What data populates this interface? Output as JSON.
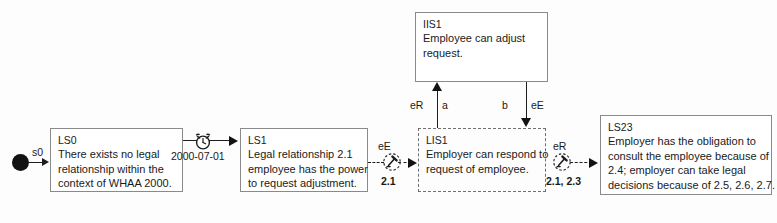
{
  "diagram": {
    "start_node": {
      "name": "start-state",
      "label": "s0"
    },
    "states": [
      {
        "id": "LS0",
        "style": "solid",
        "lines": [
          "There exists no legal",
          "relationship within the",
          "context of WHAA 2000."
        ]
      },
      {
        "id": "LS1",
        "style": "solid",
        "lines": [
          "Legal relationship 2.1",
          "employee has the power",
          "to request adjustment."
        ]
      },
      {
        "id": "LIS1",
        "style": "dashed",
        "lines": [
          "Employer can respond to",
          "request of employee."
        ]
      },
      {
        "id": "IIS1",
        "style": "solid",
        "lines": [
          "Employee can adjust",
          "request."
        ]
      },
      {
        "id": "LS23",
        "style": "solid",
        "lines": [
          "Employer has the obligation to",
          "consult the employee because of",
          "2.4; employer can take legal",
          "decisions because of 2.5, 2.6, 2.7."
        ]
      }
    ],
    "transitions": {
      "clock_date": "2000-07-01",
      "t1_top": "eE",
      "t1_bottom": "2.1",
      "t2_top": "eR",
      "t2_bottom": "2.1, 2.3",
      "up_left": "eR",
      "up_right": "a",
      "down_left": "b",
      "down_right": "eE"
    },
    "icons": {
      "clock": "alarm-clock-icon",
      "action_left": "gavel-icon",
      "action_right": "gavel-icon"
    },
    "colors": {
      "stroke": "#1d1d1d",
      "box_border": "#8a8a8a",
      "text": "#1a1a1a",
      "background": "#fdfdfd"
    }
  }
}
